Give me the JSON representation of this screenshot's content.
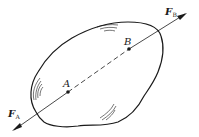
{
  "diagram": {
    "type": "rigid-body-two-force-member",
    "forces": [
      {
        "id": "FA",
        "symbol": "F",
        "subscript": "A",
        "direction": "down-left"
      },
      {
        "id": "FB",
        "symbol": "F",
        "subscript": "B",
        "direction": "up-right"
      }
    ],
    "points": [
      {
        "id": "A",
        "label": "A"
      },
      {
        "id": "B",
        "label": "B"
      }
    ],
    "line_of_action": {
      "segment_AB_style": "dashed",
      "outer_style": "solid"
    },
    "colors": {
      "ink": "#1a1a1a",
      "background": "#ffffff"
    }
  }
}
